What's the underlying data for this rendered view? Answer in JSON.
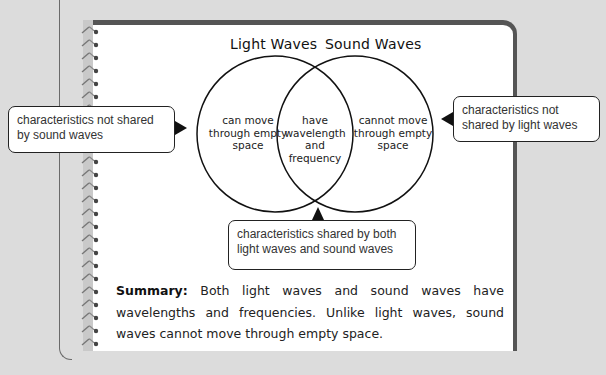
{
  "venn": {
    "left_title": "Light Waves",
    "right_title": "Sound Waves",
    "left_only": [
      "can move",
      "through empty",
      "space"
    ],
    "overlap": [
      "have",
      "wavelength",
      "and",
      "frequency"
    ],
    "right_only": [
      "cannot move",
      "through empty",
      "space"
    ]
  },
  "callouts": {
    "left": "characteristics not shared by sound waves",
    "right": "characteristics not shared by light waves",
    "bottom": "characteristics shared by both light waves and sound waves"
  },
  "summary": {
    "label": "Summary:",
    "text": " Both light waves and sound waves have wavelengths and frequencies. Unlike light waves, sound waves cannot move through empty space."
  },
  "colors": {
    "background": "#dcdcdc",
    "page": "#ffffff",
    "frame": "#555555",
    "ink": "#111111"
  }
}
